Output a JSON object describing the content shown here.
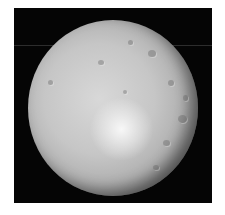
{
  "image": {
    "subject": "cratered moon",
    "description": "Grayscale photograph of a heavily cratered icy moon, gibbous/full phase, against black space",
    "colors": {
      "background": "#ffffff",
      "space": "#050505",
      "surface_light": "#d8d8d8",
      "surface_dark": "#4a4a4a"
    }
  }
}
